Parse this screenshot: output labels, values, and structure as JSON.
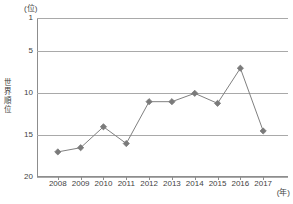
{
  "chart_data": {
    "type": "line",
    "title": "",
    "subtitle": "",
    "xlabel": "(年)",
    "ylabel": "世界順位",
    "y_unit_label": "(位)",
    "x_unit_label": "(年)",
    "categories": [
      "2008",
      "2009",
      "2010",
      "2011",
      "2012",
      "2013",
      "2014",
      "2015",
      "2016",
      "2017"
    ],
    "x": [
      2008,
      2009,
      2010,
      2011,
      2012,
      2013,
      2014,
      2015,
      2016,
      2017
    ],
    "values": [
      17,
      16.5,
      14,
      16,
      11,
      11,
      10,
      11.2,
      7,
      14.5
    ],
    "series": [
      {
        "name": "世界順位",
        "values": [
          17,
          16.5,
          14,
          16,
          11,
          11,
          10,
          11.2,
          7,
          14.5
        ]
      }
    ],
    "ylim": [
      1,
      20
    ],
    "y_inverted": true,
    "yticks": [
      1,
      5,
      10,
      15,
      20
    ],
    "ytick_labels": [
      "1",
      "5",
      "10",
      "15",
      "20"
    ],
    "grid": true,
    "grid_axis": "y",
    "legend": false,
    "legend_position": "none",
    "marker": "diamond",
    "line_color": "#808080",
    "marker_color": "#7a7a7a",
    "grid_color": "#a9a9a9",
    "axis_color": "#8d8d8d",
    "background": "#ffffff"
  },
  "axis": {
    "y_title_chars": [
      "世",
      "界",
      "順",
      "位"
    ],
    "y_unit": "(位)",
    "x_unit": "(年)"
  },
  "caption": {
    "text": ""
  }
}
